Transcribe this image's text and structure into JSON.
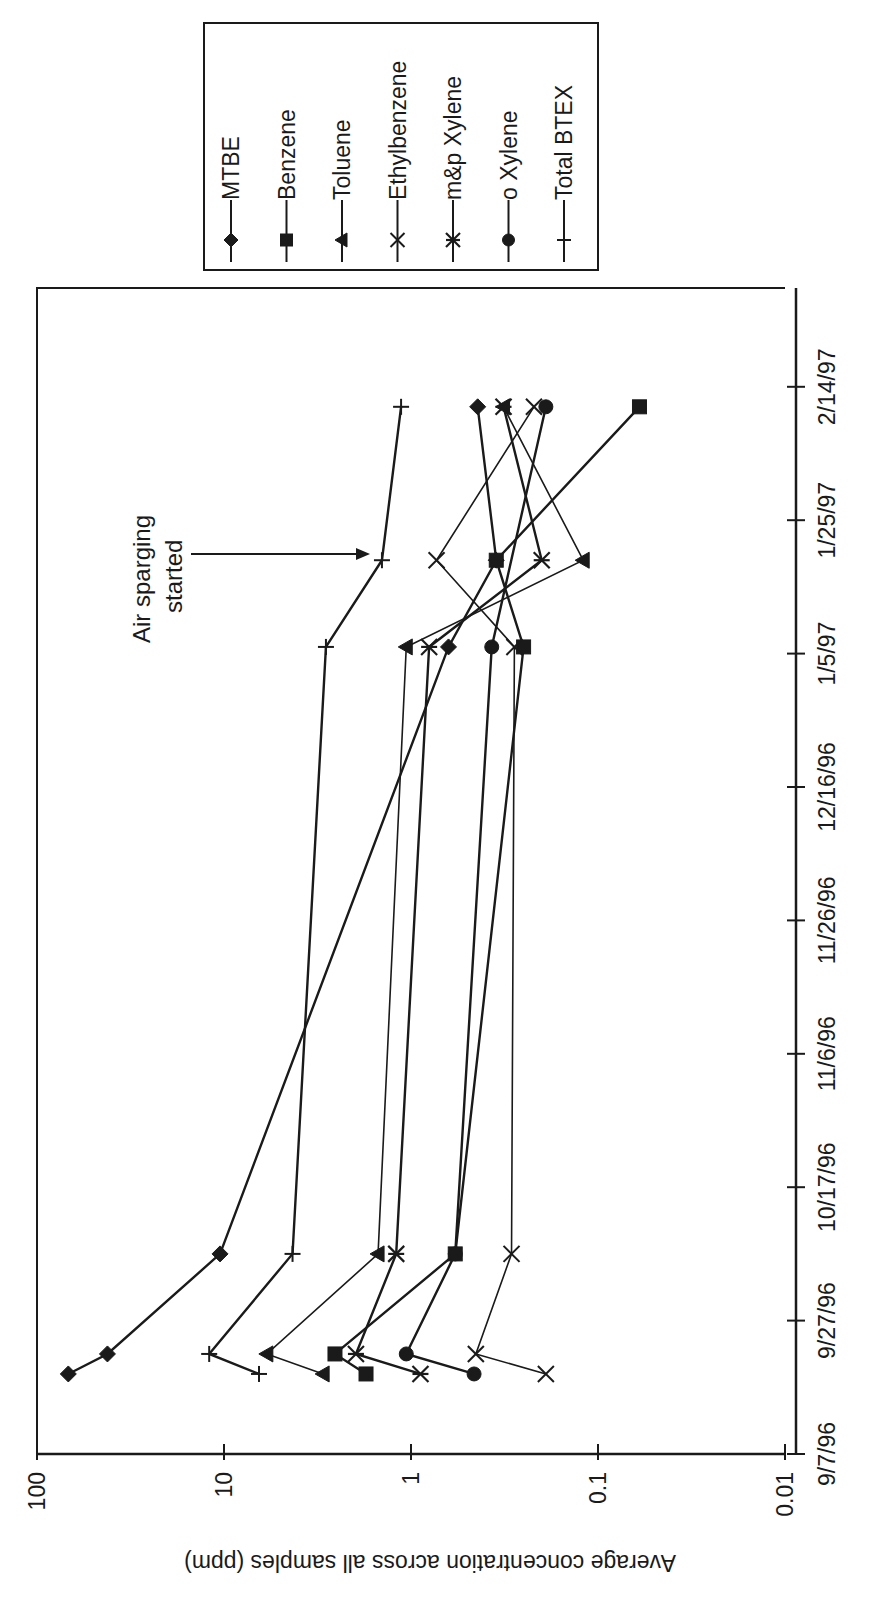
{
  "page": {
    "width": 886,
    "height": 1601,
    "rotation": "chart rotated 90 degrees counter-clockwise"
  },
  "chart_data": {
    "type": "line",
    "title": "",
    "xlabel": "",
    "ylabel": "Average concentration across all samples (ppm)",
    "y_scale": "log",
    "ylim": [
      0.01,
      100
    ],
    "y_ticks": [
      "100",
      "10",
      "1",
      "0.1",
      "0.01"
    ],
    "y_tick_values": [
      100,
      10,
      1,
      0.1,
      0.01
    ],
    "x_ticks": [
      "9/7/96",
      "9/27/96",
      "10/17/96",
      "11/6/96",
      "11/26/96",
      "12/16/96",
      "1/5/97",
      "1/25/97",
      "2/14/97"
    ],
    "x_tick_days": [
      0,
      20,
      40,
      60,
      80,
      100,
      120,
      140,
      160
    ],
    "xlim_days": [
      0,
      175
    ],
    "grid": false,
    "legend_position": "outside, beside plot",
    "x": [
      "9/19/96",
      "9/22/96",
      "10/7/96",
      "1/6/97",
      "1/19/97",
      "2/11/97"
    ],
    "x_days": [
      12,
      15,
      30,
      121,
      134,
      157
    ],
    "series": [
      {
        "name": "MTBE",
        "marker": "diamond",
        "values": [
          68,
          42,
          10.5,
          0.63,
          0.35,
          0.44
        ]
      },
      {
        "name": "Benzene",
        "marker": "square",
        "values": [
          1.74,
          2.55,
          0.58,
          0.25,
          0.35,
          0.06
        ]
      },
      {
        "name": "Toluene",
        "marker": "triangle",
        "values": [
          2.95,
          5.9,
          1.5,
          1.06,
          0.12,
          0.32
        ]
      },
      {
        "name": "Ethylbenzene",
        "marker": "x",
        "values": [
          0.19,
          0.45,
          0.29,
          0.28,
          0.73,
          0.22
        ]
      },
      {
        "name": "m&p Xylene",
        "marker": "asterisk",
        "values": [
          0.89,
          1.97,
          1.2,
          0.8,
          0.2,
          0.32
        ]
      },
      {
        "name": "o Xylene",
        "marker": "circle",
        "values": [
          0.46,
          1.06,
          0.58,
          0.37,
          null,
          0.19
        ]
      },
      {
        "name": "Total BTEX",
        "marker": "plus",
        "values": [
          6.5,
          12,
          4.3,
          2.85,
          1.43,
          1.13
        ]
      }
    ],
    "annotations": [
      {
        "text_lines": [
          "Air sparging",
          "started"
        ],
        "arrow_to_series": "Total BTEX",
        "arrow_to_date": "1/19/97"
      }
    ]
  },
  "legend": {
    "items": [
      {
        "label": "MTBE",
        "marker": "diamond"
      },
      {
        "label": "Benzene",
        "marker": "square"
      },
      {
        "label": "Toluene",
        "marker": "triangle"
      },
      {
        "label": "Ethylbenzene",
        "marker": "x"
      },
      {
        "label": "m&p Xylene",
        "marker": "asterisk"
      },
      {
        "label": "o Xylene",
        "marker": "circle"
      },
      {
        "label": "Total BTEX",
        "marker": "plus"
      }
    ]
  },
  "annotation": {
    "line1": "Air sparging",
    "line2": "started"
  },
  "colors": {
    "ink": "#1a1a1a",
    "background": "#ffffff"
  }
}
